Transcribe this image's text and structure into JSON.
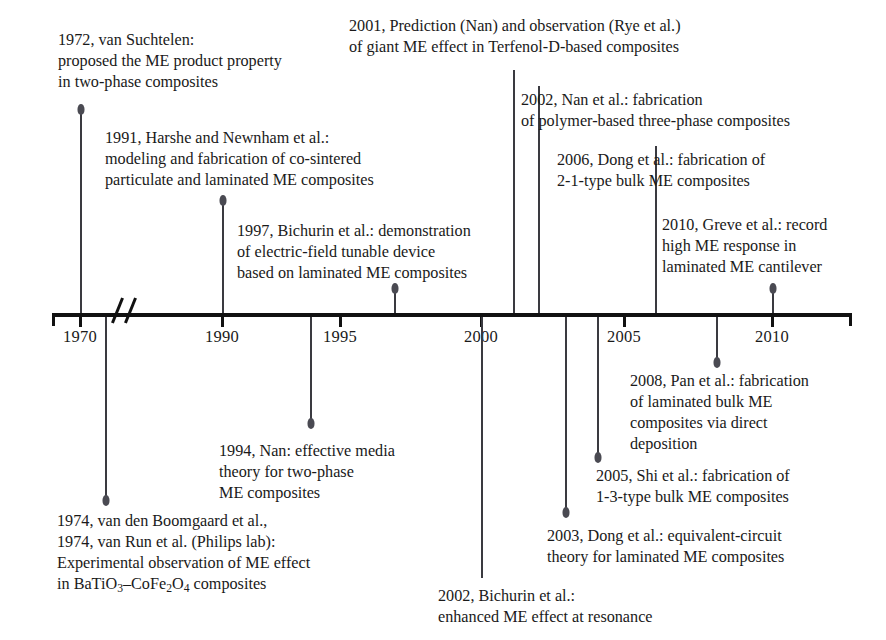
{
  "figure": {
    "type": "timeline",
    "title_present": false,
    "axis": {
      "name": "year-axis",
      "tick_labels": [
        "1970",
        "1990",
        "1995",
        "2000",
        "2005",
        "2010"
      ],
      "tick_x": [
        80,
        222,
        340,
        481,
        624,
        772
      ],
      "has_break": true,
      "break_after": "1970",
      "start_x": 52,
      "end_x": 852,
      "baseline_y": 313
    },
    "events": [
      {
        "id": "1972-van-suchtelen",
        "year": "1972",
        "side": "above",
        "anchor_x": 80,
        "lines": [
          "1972, van Suchtelen:",
          "proposed the ME product property",
          "in two-phase composites"
        ],
        "text": "1972, van Suchtelen:\nproposed the ME product property\nin two-phase composites",
        "text_x": 58,
        "text_y": 30,
        "head_y": 104,
        "conn_top": 110,
        "conn_bottom": 313
      },
      {
        "id": "1991-harshe-newnham",
        "year": "1991",
        "side": "above",
        "anchor_x": 222,
        "lines": [
          "1991, Harshe and Newnham et al.:",
          "modeling and fabrication of co-sintered",
          "particulate and laminated ME composites"
        ],
        "text": "1991, Harshe and Newnham et al.:\nmodeling and fabrication of co-sintered\nparticulate and laminated ME composites",
        "text_x": 105,
        "text_y": 128,
        "head_y": 195,
        "conn_top": 201,
        "conn_bottom": 313
      },
      {
        "id": "1997-bichurin",
        "year": "1997",
        "side": "above",
        "anchor_x": 394,
        "lines": [
          "1997, Bichurin et al.: demonstration",
          "of electric-field tunable device",
          "based on laminated ME composites"
        ],
        "text": "1997, Bichurin et al.: demonstration\nof electric-field tunable device\nbased on laminated ME composites",
        "text_x": 237,
        "text_y": 221,
        "head_y": 283,
        "conn_top": 289,
        "conn_bottom": 313
      },
      {
        "id": "2001-prediction-nan-rye",
        "year": "2001",
        "side": "above",
        "anchor_x": 513,
        "lines": [
          "2001, Prediction (Nan) and observation (Rye et al.)",
          "of giant ME effect in Terfenol-D-based composites"
        ],
        "text": "2001, Prediction (Nan) and observation (Rye et al.)\nof giant ME effect in Terfenol-D-based composites",
        "text_x": 349,
        "text_y": 16,
        "head_y": null,
        "conn_top": 70,
        "conn_bottom": 313
      },
      {
        "id": "2002-nan",
        "year": "2002",
        "side": "above",
        "anchor_x": 538,
        "lines": [
          "2002, Nan et al.: fabrication",
          "of polymer-based three-phase composites"
        ],
        "text": "2002, Nan et al.: fabrication\nof polymer-based three-phase composites",
        "text_x": 521,
        "text_y": 90,
        "head_y": null,
        "conn_top": 86,
        "conn_bottom": 313
      },
      {
        "id": "2006-dong",
        "year": "2006",
        "side": "above",
        "anchor_x": 655,
        "lines": [
          "2006, Dong et al.: fabrication of",
          "2-1-type bulk ME composites"
        ],
        "text": "2006, Dong et al.: fabrication of\n2-1-type bulk ME composites",
        "text_x": 557,
        "text_y": 150,
        "head_y": null,
        "conn_top": 146,
        "conn_bottom": 313
      },
      {
        "id": "2010-greve",
        "year": "2010",
        "side": "above",
        "anchor_x": 772,
        "lines": [
          "2010, Greve et al.: record",
          "high ME response in",
          "laminated ME cantilever"
        ],
        "text": "2010, Greve et al.: record\nhigh ME response in\nlaminated ME cantilever",
        "text_x": 662,
        "text_y": 215,
        "head_y": 283,
        "conn_top": 289,
        "conn_bottom": 313
      },
      {
        "id": "1994-nan",
        "year": "1994",
        "side": "below",
        "anchor_x": 310,
        "lines": [
          "1994, Nan: effective media",
          "theory for two-phase",
          "ME composites"
        ],
        "text": "1994, Nan: effective media\ntheory for two-phase\nME composites",
        "text_x": 219,
        "text_y": 441,
        "head_y": 418,
        "conn_top": 317,
        "conn_bottom": 422
      },
      {
        "id": "1974-boomgaard-vanrun",
        "year": "1974",
        "side": "below",
        "anchor_x": 105,
        "lines": [
          "1974, van den Boomgaard et al.,",
          "1974, van Run et al. (Philips lab):",
          "Experimental observation of ME effect",
          "in BaTiO3–CoFe2O4 composites"
        ],
        "text": "1974, van den Boomgaard et al.,\n1974, van Run et al. (Philips lab):\nExperimental observation of ME effect",
        "formula_prefix": "in BaTiO",
        "formula_sub1": "3",
        "formula_mid": "–CoFe",
        "formula_sub2": "2",
        "formula_mid2": "O",
        "formula_sub3": "4",
        "formula_suffix": " composites",
        "text_x": 57,
        "text_y": 511,
        "head_y": 495,
        "conn_top": 317,
        "conn_bottom": 499
      },
      {
        "id": "2005-shi",
        "year": "2005",
        "side": "below",
        "anchor_x": 597,
        "lines": [
          "2005, Shi et al.: fabrication of",
          "1-3-type bulk ME composites"
        ],
        "text": "2005, Shi et al.: fabrication of\n1-3-type bulk ME composites",
        "text_x": 596,
        "text_y": 466,
        "head_y": 452,
        "conn_top": 317,
        "conn_bottom": 456
      },
      {
        "id": "2003-dong",
        "year": "2003",
        "side": "below",
        "anchor_x": 565,
        "lines": [
          "2003, Dong et al.: equivalent-circuit",
          "theory for laminated ME composites"
        ],
        "text": "2003, Dong et al.: equivalent-circuit\ntheory for laminated ME composites",
        "text_x": 547,
        "text_y": 526,
        "head_y": 507,
        "conn_top": 317,
        "conn_bottom": 511
      },
      {
        "id": "2008-pan",
        "year": "2008",
        "side": "below",
        "anchor_x": 716,
        "lines": [
          "2008, Pan et al.: fabrication",
          "of laminated bulk ME",
          "composites via direct",
          "deposition"
        ],
        "text": "2008, Pan et al.: fabrication\nof laminated bulk ME\ncomposites via direct\ndeposition",
        "text_x": 630,
        "text_y": 371,
        "head_y": 357,
        "conn_top": 317,
        "conn_bottom": 361
      },
      {
        "id": "2002-bichurin",
        "year": "2002",
        "side": "below",
        "anchor_x": 481,
        "lines": [
          "2002, Bichurin et al.:",
          "enhanced ME effect at resonance"
        ],
        "text": "2002, Bichurin et al.:\nenhanced ME effect at resonance",
        "text_x": 438,
        "text_y": 586,
        "head_y": null,
        "conn_top": 317,
        "conn_bottom": 578
      }
    ],
    "colors": {
      "axis": "#111111",
      "text": "#1a1a1a",
      "connector": "#3a3a40",
      "background": "#ffffff"
    }
  }
}
